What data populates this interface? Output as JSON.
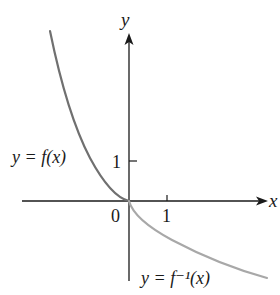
{
  "diagram": {
    "type": "function-and-inverse-graph",
    "axes": {
      "x_label": "x",
      "y_label": "y",
      "origin_label": "0",
      "x_tick_label": "1",
      "y_tick_label": "1"
    },
    "curves": [
      {
        "name": "f",
        "label": "y = f(x)",
        "color": "#707070",
        "description": "decreasing curve in quadrant II passing through the origin"
      },
      {
        "name": "f-inverse",
        "label": "y = f⁻¹(x)",
        "color": "#a8a8a8",
        "description": "decreasing curve in quadrant IV starting from the origin"
      }
    ],
    "colors": {
      "axis": "#1a1a1a",
      "background": "#ffffff"
    }
  }
}
